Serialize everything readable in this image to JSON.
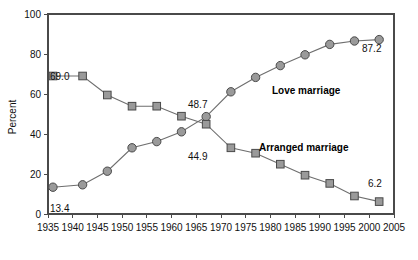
{
  "chart_data": {
    "type": "line",
    "title": "",
    "xlabel": "",
    "ylabel": "Percent",
    "xlim": [
      1935,
      2005
    ],
    "ylim": [
      0,
      100
    ],
    "grid": false,
    "legend_position": "inline-annotation",
    "x_ticks": [
      1935,
      1940,
      1945,
      1950,
      1955,
      1960,
      1965,
      1970,
      1975,
      1980,
      1985,
      1990,
      1995,
      2000,
      2005
    ],
    "y_ticks": [
      0,
      20,
      40,
      60,
      80,
      100
    ],
    "x": [
      1936,
      1942,
      1947,
      1952,
      1957,
      1962,
      1967,
      1972,
      1977,
      1982,
      1987,
      1992,
      1997,
      2002
    ],
    "series": [
      {
        "name": "Love marriage",
        "marker": "circle",
        "values": [
          13.4,
          14.6,
          21.4,
          33.1,
          36.2,
          41.1,
          48.7,
          61.1,
          68.3,
          74.2,
          79.6,
          84.8,
          86.5,
          87.2
        ]
      },
      {
        "name": "Arranged marriage",
        "marker": "square",
        "values": [
          69.0,
          69.0,
          59.5,
          53.9,
          53.9,
          48.9,
          44.9,
          33.1,
          30.4,
          24.9,
          19.4,
          15.3,
          9.0,
          6.2
        ]
      }
    ],
    "annotations": [
      {
        "text": "69.0",
        "series": "Arranged marriage",
        "x": 1936,
        "value": 69.0
      },
      {
        "text": "13.4",
        "series": "Love marriage",
        "x": 1936,
        "value": 13.4
      },
      {
        "text": "48.7",
        "series": "Love marriage",
        "x": 1967,
        "value": 48.7
      },
      {
        "text": "44.9",
        "series": "Arranged marriage",
        "x": 1967,
        "value": 44.9
      },
      {
        "text": "87.2",
        "series": "Love marriage",
        "x": 2002,
        "value": 87.2
      },
      {
        "text": "6.2",
        "series": "Arranged marriage",
        "x": 2002,
        "value": 6.2
      }
    ],
    "series_labels": [
      {
        "text": "Love marriage"
      },
      {
        "text": "Arranged marriage"
      }
    ]
  },
  "axis": {
    "y_title": "Percent",
    "y_ticks": [
      "0",
      "20",
      "40",
      "60",
      "80",
      "100"
    ],
    "x_ticks": [
      "1935",
      "1940",
      "1945",
      "1950",
      "1955",
      "1960",
      "1965",
      "1970",
      "1975",
      "1980",
      "1985",
      "1990",
      "1995",
      "2000",
      "2005"
    ]
  },
  "labels": {
    "love": "Love marriage",
    "arranged": "Arranged marriage",
    "v_69": "69.0",
    "v_134": "13.4",
    "v_487": "48.7",
    "v_449": "44.9",
    "v_872": "87.2",
    "v_62": "6.2"
  },
  "colors": {
    "marker_fill": "#9a9a9a",
    "marker_stroke": "#4a4a4a",
    "line": "#6e6e6e",
    "axis": "#4a4a4a",
    "text": "#111111",
    "background": "#ffffff"
  }
}
